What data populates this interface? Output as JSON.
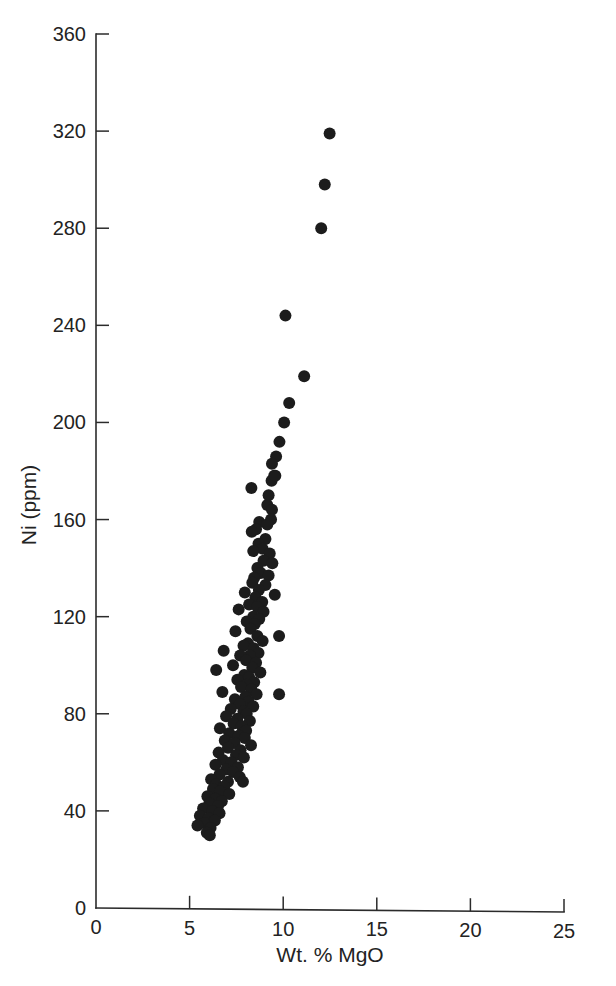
{
  "chart_data": {
    "type": "scatter",
    "title": "",
    "xlabel": "Wt. % MgO",
    "ylabel": "Ni (ppm)",
    "xlim": [
      0,
      25
    ],
    "ylim": [
      0,
      360
    ],
    "xticks": [
      0,
      5,
      10,
      15,
      20,
      25
    ],
    "yticks": [
      0,
      40,
      80,
      120,
      160,
      200,
      240,
      280,
      320,
      360
    ],
    "grid": false,
    "legend": null,
    "marker": {
      "shape": "circle",
      "color": "#1c1c1c",
      "size_px": 12
    },
    "series": [
      {
        "name": "samples",
        "points": [
          [
            12.48,
            319
          ],
          [
            12.22,
            298
          ],
          [
            12.03,
            280
          ],
          [
            10.12,
            244
          ],
          [
            11.12,
            219
          ],
          [
            10.32,
            208
          ],
          [
            10.05,
            200
          ],
          [
            9.8,
            192
          ],
          [
            9.62,
            186
          ],
          [
            9.4,
            183
          ],
          [
            9.52,
            178
          ],
          [
            9.38,
            176
          ],
          [
            8.3,
            173
          ],
          [
            9.58,
            178
          ],
          [
            9.22,
            170
          ],
          [
            9.15,
            166
          ],
          [
            9.4,
            164
          ],
          [
            9.35,
            160
          ],
          [
            8.72,
            159
          ],
          [
            9.15,
            158
          ],
          [
            8.55,
            156
          ],
          [
            8.32,
            155
          ],
          [
            9.05,
            152
          ],
          [
            8.68,
            150
          ],
          [
            8.9,
            148
          ],
          [
            8.4,
            147
          ],
          [
            9.28,
            146
          ],
          [
            8.95,
            143
          ],
          [
            9.42,
            142
          ],
          [
            8.62,
            140
          ],
          [
            8.8,
            138
          ],
          [
            9.22,
            137
          ],
          [
            8.45,
            136
          ],
          [
            8.35,
            134
          ],
          [
            9.05,
            133
          ],
          [
            8.7,
            131
          ],
          [
            7.95,
            130
          ],
          [
            9.55,
            129
          ],
          [
            8.52,
            128
          ],
          [
            8.88,
            126
          ],
          [
            8.18,
            125
          ],
          [
            8.62,
            124
          ],
          [
            7.62,
            123
          ],
          [
            8.95,
            122
          ],
          [
            8.4,
            120
          ],
          [
            8.72,
            119
          ],
          [
            8.05,
            118
          ],
          [
            8.48,
            117
          ],
          [
            9.78,
            112
          ],
          [
            8.25,
            115
          ],
          [
            7.45,
            114
          ],
          [
            8.62,
            112
          ],
          [
            8.9,
            110
          ],
          [
            8.12,
            109
          ],
          [
            7.88,
            108
          ],
          [
            8.42,
            107
          ],
          [
            6.82,
            106
          ],
          [
            8.68,
            105
          ],
          [
            8.22,
            104
          ],
          [
            7.7,
            104
          ],
          [
            8.02,
            102
          ],
          [
            8.55,
            101
          ],
          [
            7.32,
            100
          ],
          [
            8.35,
            99
          ],
          [
            6.42,
            98
          ],
          [
            8.78,
            97
          ],
          [
            7.92,
            96
          ],
          [
            8.18,
            95
          ],
          [
            7.55,
            94
          ],
          [
            8.45,
            93
          ],
          [
            8.05,
            92
          ],
          [
            7.75,
            91
          ],
          [
            9.78,
            88
          ],
          [
            8.3,
            90
          ],
          [
            6.75,
            89
          ],
          [
            8.58,
            88
          ],
          [
            7.98,
            87
          ],
          [
            7.42,
            86
          ],
          [
            8.15,
            85
          ],
          [
            7.68,
            84
          ],
          [
            8.4,
            83
          ],
          [
            7.2,
            82
          ],
          [
            7.88,
            81
          ],
          [
            8.05,
            80
          ],
          [
            6.95,
            79
          ],
          [
            7.55,
            78
          ],
          [
            8.22,
            77
          ],
          [
            7.35,
            76
          ],
          [
            7.78,
            75
          ],
          [
            6.62,
            74
          ],
          [
            8.02,
            73
          ],
          [
            7.12,
            72
          ],
          [
            7.62,
            71
          ],
          [
            7.95,
            70
          ],
          [
            6.88,
            69
          ],
          [
            7.4,
            68
          ],
          [
            8.28,
            67
          ],
          [
            7.05,
            66
          ],
          [
            7.72,
            65
          ],
          [
            6.55,
            64
          ],
          [
            7.48,
            63
          ],
          [
            7.9,
            62
          ],
          [
            6.78,
            61
          ],
          [
            7.22,
            60
          ],
          [
            6.38,
            59
          ],
          [
            7.58,
            58
          ],
          [
            6.95,
            57
          ],
          [
            7.32,
            56
          ],
          [
            6.6,
            55
          ],
          [
            7.68,
            54
          ],
          [
            6.15,
            53
          ],
          [
            7.05,
            52
          ],
          [
            7.85,
            52
          ],
          [
            6.42,
            51
          ],
          [
            6.85,
            50
          ],
          [
            6.25,
            49
          ],
          [
            6.62,
            48
          ],
          [
            7.12,
            47
          ],
          [
            5.95,
            46
          ],
          [
            6.38,
            45
          ],
          [
            6.72,
            44
          ],
          [
            6.05,
            43
          ],
          [
            6.52,
            42
          ],
          [
            5.72,
            41
          ],
          [
            6.22,
            40
          ],
          [
            6.6,
            39
          ],
          [
            5.55,
            38
          ],
          [
            6.02,
            37
          ],
          [
            6.35,
            36
          ],
          [
            5.78,
            35
          ],
          [
            5.42,
            34
          ],
          [
            6.12,
            33
          ],
          [
            5.92,
            31
          ],
          [
            6.08,
            30
          ]
        ]
      }
    ]
  }
}
